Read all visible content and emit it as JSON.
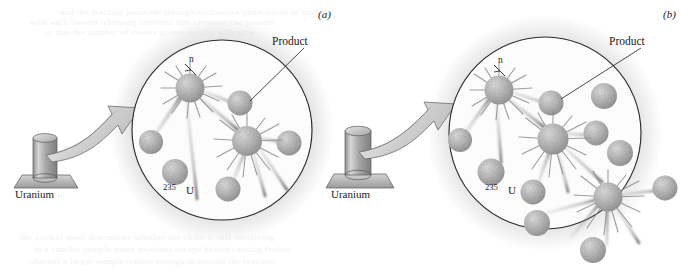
{
  "figure": {
    "background_color": "#ffffff",
    "ink_color": "#1b1b1b",
    "sphere_fill": "#b8b8b8",
    "arrow_fill": "#c9c9c9",
    "halo_color": "#d8d8d8"
  },
  "panels": [
    {
      "id": "a",
      "label": "(a)",
      "label_x": 318,
      "label_y": 18,
      "circle": {
        "cx": 222,
        "cy": 130,
        "r": 90
      },
      "source": {
        "label": "Uranium",
        "label_x": 45,
        "label_y": 196,
        "cylinder_x": 33,
        "cylinder_y": 133,
        "cylinder_w": 24,
        "cylinder_h": 46
      },
      "callouts": [
        {
          "name": "neutron",
          "text": "n",
          "x": 189,
          "y": 62
        },
        {
          "name": "product",
          "text": "Product",
          "x": 272,
          "y": 45
        },
        {
          "name": "isotope_mass",
          "text": "235",
          "x": 163,
          "y": 190
        },
        {
          "name": "isotope_symbol",
          "text": "U",
          "x": 186,
          "y": 194
        }
      ],
      "fission_events": 2,
      "free_nuclei": 6,
      "escaping": false
    },
    {
      "id": "b",
      "label": "(b)",
      "label_x": 663,
      "label_y": 18,
      "circle": {
        "cx": 545,
        "cy": 133,
        "r": 96
      },
      "source": {
        "label": "Uranium",
        "label_x": 352,
        "label_y": 196,
        "cylinder_x": 345,
        "cylinder_y": 128,
        "cylinder_w": 26,
        "cylinder_h": 50
      },
      "callouts": [
        {
          "name": "neutron",
          "text": "n",
          "x": 498,
          "y": 63
        },
        {
          "name": "product",
          "text": "Product",
          "x": 609,
          "y": 45
        },
        {
          "name": "isotope_mass",
          "text": "235",
          "x": 485,
          "y": 190
        },
        {
          "name": "isotope_symbol",
          "text": "U",
          "x": 508,
          "y": 194
        }
      ],
      "fission_events": 3,
      "free_nuclei": 10,
      "escaping": true
    }
  ],
  "ghost_text": {
    "note": "faint show-through text from reverse of printed page, illegible",
    "lines": [
      {
        "x": 60,
        "y": 7,
        "text": "and the reaction proceeds through successive generations of nuclei"
      },
      {
        "x": 30,
        "y": 17,
        "text": "with each fission releasing neutrons that continue the process"
      },
      {
        "x": 44,
        "y": 27,
        "text": "so that the number of events grows rapidly with time"
      },
      {
        "x": 20,
        "y": 232,
        "text": "the critical mass determines whether the chain is self sustaining"
      },
      {
        "x": 34,
        "y": 244,
        "text": "in a smaller sample many neutrons escape before causing fission"
      },
      {
        "x": 28,
        "y": 256,
        "text": "whereas a larger sample retains enough to sustain the reaction"
      }
    ]
  }
}
